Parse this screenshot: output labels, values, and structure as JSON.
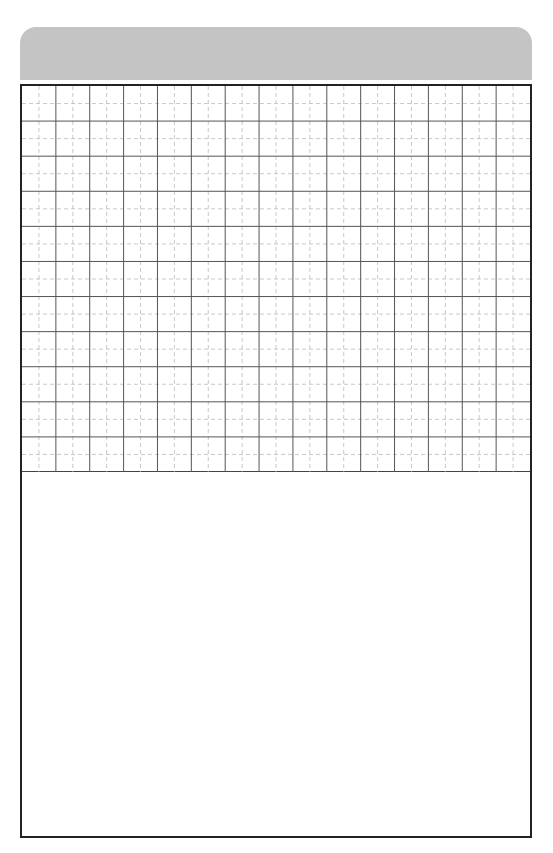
{
  "header": {
    "title": "",
    "color": "#c4c4c4"
  },
  "grid": {
    "columns": 15,
    "rows": 11,
    "cell_width": 33.87,
    "cell_height": 35.09,
    "solid_line_color": "#555555",
    "dashed_line_color": "#bbbbbb",
    "border_color": "#222222"
  },
  "writing_area": {
    "text": ""
  }
}
